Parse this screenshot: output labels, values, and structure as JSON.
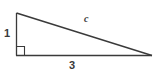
{
  "figure": {
    "kind": "right-triangle-diagram",
    "background_color": "#ffffff",
    "stroke_color": "#3a3a3a",
    "labels": {
      "vertical_leg": "1",
      "horizontal_leg": "3",
      "hypotenuse": "c"
    },
    "geometry": {
      "apex": [
        16,
        13
      ],
      "right_angle_vertex": [
        16,
        55
      ],
      "right_vertex": [
        152,
        55
      ],
      "right_angle_marker_size": 9
    }
  }
}
